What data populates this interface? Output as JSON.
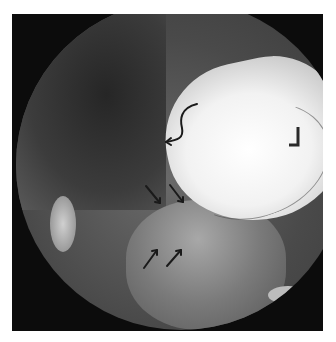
{
  "image": {
    "type": "fluoroscopy",
    "description": "Upper GI contrast study showing barium-filled stomach with annotation arrows",
    "side_marker": "L"
  },
  "annotations": {
    "curved_arrow": {
      "count": 1
    },
    "straight_arrows_pointing_down": {
      "count": 2
    },
    "straight_arrows_pointing_up": {
      "count": 2
    },
    "arrow_color": "#1a1a1a"
  },
  "colors": {
    "background": "#ffffff",
    "frame": "#0c0c0c",
    "contrast_fill": "#ffffff"
  }
}
